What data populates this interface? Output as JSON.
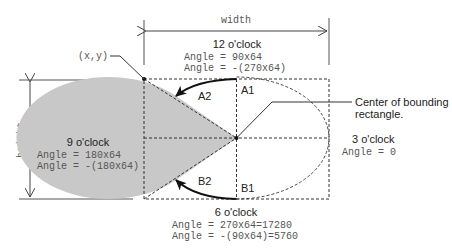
{
  "diagram": {
    "dimensions": {
      "width_label": "width",
      "height_label": "height"
    },
    "origin_label": "(x,y)",
    "center_label_line1": "Center of bounding",
    "center_label_line2": "rectangle.",
    "regions": {
      "a1": "A1",
      "a2": "A2",
      "b1": "B1",
      "b2": "B2"
    },
    "clock_labels": {
      "twelve": {
        "title": "12 o'clock",
        "line1": "Angle = 90x64",
        "line2": "Angle = -(270x64)"
      },
      "nine": {
        "title": "9 o'clock",
        "line1": "Angle = 180x64",
        "line2": "Angle = -(180x64)"
      },
      "three": {
        "title": "3 o'clock",
        "line1": "Angle = 0"
      },
      "six": {
        "title": "6 o'clock",
        "line1": "Angle = 270x64=17280",
        "line2": "Angle = -(90x64)=5760"
      }
    },
    "colors": {
      "fill": "#c8c8c8",
      "line": "#333333",
      "text": "#222222",
      "mono_text": "#555555"
    }
  }
}
